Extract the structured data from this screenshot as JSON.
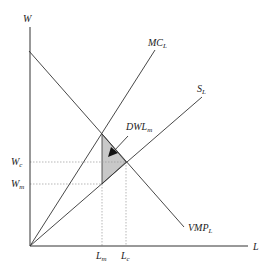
{
  "diagram": {
    "axes": {
      "y_label": "W",
      "x_label": "L"
    },
    "curves": [
      {
        "name": "MC",
        "sub": "L",
        "from": [
          30,
          246
        ],
        "to": [
          155,
          50
        ],
        "label_pos": [
          150,
          46
        ]
      },
      {
        "name": "S",
        "sub": "L",
        "from": [
          30,
          246
        ],
        "to": [
          202,
          97
        ],
        "label_pos": [
          198,
          92
        ]
      },
      {
        "name": "VMP",
        "sub": "L",
        "from": [
          29,
          51
        ],
        "to": [
          184,
          227
        ],
        "label_pos": [
          188,
          230
        ]
      }
    ],
    "dwl": {
      "name": "DWL",
      "sub": "m",
      "label_pos": [
        126,
        129
      ],
      "fill": "#c8c8c8",
      "vertices": [
        [
          102,
          134
        ],
        [
          126,
          162
        ],
        [
          102,
          184
        ]
      ]
    },
    "y_ticks": [
      {
        "name": "W",
        "sub": "c",
        "y": 162
      },
      {
        "name": "W",
        "sub": "m",
        "y": 184
      }
    ],
    "x_ticks": [
      {
        "name": "L",
        "sub": "m",
        "x": 102
      },
      {
        "name": "L",
        "sub": "c",
        "x": 126
      }
    ],
    "colors": {
      "line": "#333333",
      "dotted": "#999999"
    }
  }
}
